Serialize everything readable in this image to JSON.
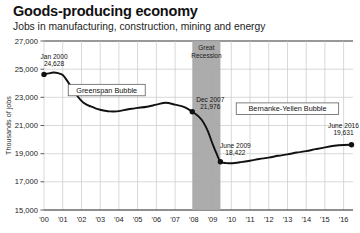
{
  "header": {
    "title": "Goods-producing economy",
    "subtitle": "Jobs in manufacturing, construction, mining and energy"
  },
  "chart_data": {
    "type": "line",
    "title": "Goods-producing economy",
    "subtitle": "Jobs in manufacturing, construction, mining and energy",
    "xlabel": "",
    "ylabel": "Thousands of jobs",
    "xlim": [
      2000,
      2016.5
    ],
    "ylim": [
      15000,
      27000
    ],
    "grid": true,
    "legend_position": "none",
    "ytick_labels": [
      "27,000",
      "25,000",
      "23,000",
      "21,000",
      "19,000",
      "17,000",
      "15,000"
    ],
    "ytick_values": [
      27000,
      25000,
      23000,
      21000,
      19000,
      17000,
      15000
    ],
    "xtick_labels": [
      "'00",
      "'01",
      "'02",
      "'03",
      "'04",
      "'05",
      "'06",
      "'07",
      "'08",
      "'09",
      "'10",
      "'11",
      "'12",
      "'13",
      "'14",
      "'15",
      "'16"
    ],
    "xtick_values": [
      2000,
      2001,
      2002,
      2003,
      2004,
      2005,
      2006,
      2007,
      2008,
      2009,
      2010,
      2011,
      2012,
      2013,
      2014,
      2015,
      2016
    ],
    "series": [
      {
        "name": "Goods-producing jobs",
        "color": "#111111",
        "x": [
          2000.0,
          2000.25,
          2000.5,
          2000.75,
          2001.0,
          2001.25,
          2001.5,
          2001.75,
          2002.0,
          2002.25,
          2002.5,
          2002.75,
          2003.0,
          2003.25,
          2003.5,
          2003.75,
          2004.0,
          2004.25,
          2004.5,
          2004.75,
          2005.0,
          2005.5,
          2006.0,
          2006.5,
          2007.0,
          2007.5,
          2007.92,
          2008.25,
          2008.5,
          2008.75,
          2009.0,
          2009.25,
          2009.42,
          2009.75,
          2010.0,
          2010.5,
          2011.0,
          2011.5,
          2012.0,
          2012.5,
          2013.0,
          2013.5,
          2014.0,
          2014.5,
          2015.0,
          2015.5,
          2016.0,
          2016.42
        ],
        "y": [
          24628,
          24700,
          24760,
          24720,
          24580,
          24150,
          23650,
          23150,
          22750,
          22500,
          22350,
          22220,
          22120,
          22050,
          22000,
          21990,
          22020,
          22090,
          22150,
          22200,
          22250,
          22330,
          22480,
          22620,
          22480,
          22300,
          21976,
          21650,
          21250,
          20600,
          19700,
          18900,
          18422,
          18330,
          18320,
          18400,
          18500,
          18620,
          18720,
          18850,
          18950,
          19080,
          19180,
          19320,
          19450,
          19560,
          19620,
          19631
        ]
      }
    ],
    "recession_band": {
      "label_line1": "Great",
      "label_line2": "Recession",
      "start": 2007.92,
      "end": 2009.42,
      "color": "#a8a8a8"
    },
    "annotations": [
      {
        "name": "jan-2000-point",
        "label_line1": "Jan 2000",
        "label_line2": "24,628",
        "x": 2000.0,
        "y": 24628,
        "marker": true
      },
      {
        "name": "dec-2007-point",
        "label_line1": "Dec 2007",
        "label_line2": "21,976",
        "x": 2007.92,
        "y": 21976,
        "marker": true
      },
      {
        "name": "june-2009-point",
        "label_line1": "June 2009",
        "label_line2": "18,422",
        "x": 2009.42,
        "y": 18422,
        "marker": true
      },
      {
        "name": "june-2016-point",
        "label_line1": "June 2016",
        "label_line2": "19,631",
        "x": 2016.42,
        "y": 19631,
        "marker": true
      }
    ],
    "boxed_labels": [
      {
        "name": "greenspan-bubble-label",
        "text": "Greenspan Bubble",
        "x": 2003.35,
        "y": 23520
      },
      {
        "name": "bernanke-yellen-bubble-label",
        "text": "Bernanke-Yellen Bubble",
        "x": 2013.0,
        "y": 22200
      }
    ]
  },
  "colors": {
    "line": "#111111",
    "grid": "#c9c9c9",
    "axis": "#333333",
    "band": "#a8a8a8",
    "background": "#ffffff"
  }
}
